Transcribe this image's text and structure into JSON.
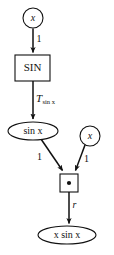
{
  "diagram": {
    "colors": {
      "background": "#ffffff",
      "stroke": "#111111",
      "text": "#111111",
      "node_fill": "#ffffff"
    },
    "nodes": [
      {
        "id": "input-x-top",
        "shape": "circle",
        "label": "x",
        "label_style": "italic",
        "cx": 33,
        "cy": 18,
        "r": 10
      },
      {
        "id": "sin-operator",
        "shape": "rect",
        "label": "SIN",
        "label_style": "upright",
        "x": 15,
        "y": 55,
        "width": 35,
        "height": 26
      },
      {
        "id": "sin-x-value",
        "shape": "ellipse",
        "label": "sin x",
        "label_style": "mixed",
        "cx": 33,
        "cy": 131,
        "rx": 25,
        "ry": 9
      },
      {
        "id": "input-x-right",
        "shape": "circle",
        "label": "x",
        "label_style": "italic",
        "cx": 90,
        "cy": 136,
        "r": 10
      },
      {
        "id": "multiply-operator",
        "shape": "rect",
        "label": "•",
        "label_style": "dot",
        "x": 60,
        "y": 174,
        "width": 18,
        "height": 18
      },
      {
        "id": "result-x-sin-x",
        "shape": "ellipse",
        "label": "x sin x",
        "label_style": "mixed",
        "cx": 67,
        "cy": 235,
        "rx": 29,
        "ry": 9
      }
    ],
    "edges": [
      {
        "id": "edge-x-to-sin",
        "from": "input-x-top",
        "to": "sin-operator",
        "label": "1",
        "label_style": "upright"
      },
      {
        "id": "edge-sin-to-sinx",
        "from": "sin-operator",
        "to": "sin-x-value",
        "label": "T",
        "label_subscript": "sin x",
        "label_style": "italic-with-subscript"
      },
      {
        "id": "edge-sinx-to-multiply",
        "from": "sin-x-value",
        "to": "multiply-operator",
        "label": "1",
        "label_style": "upright"
      },
      {
        "id": "edge-xright-to-multiply",
        "from": "input-x-right",
        "to": "multiply-operator",
        "label": "1",
        "label_style": "upright"
      },
      {
        "id": "edge-multiply-to-result",
        "from": "multiply-operator",
        "to": "result-x-sin-x",
        "label": "r",
        "label_style": "italic"
      }
    ]
  }
}
